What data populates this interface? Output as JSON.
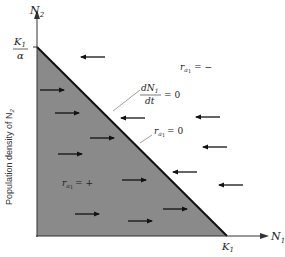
{
  "diagram": {
    "y_axis": {
      "label": "N",
      "label_sub": "2",
      "side_label": "Population density of N",
      "side_label_sub": "2",
      "intercept_num": "K",
      "intercept_num_sub": "1",
      "intercept_den": "α"
    },
    "x_axis": {
      "label": "N",
      "label_sub": "1",
      "intercept": "K",
      "intercept_sub": "1"
    },
    "isocline_label": {
      "num": "dN",
      "num_sub": "1",
      "den": "dt",
      "eq": "= 0"
    },
    "ra_zero_label": {
      "r": "r",
      "sub": "a",
      "subsub": "1",
      "eq": "= 0"
    },
    "ra_pos_label": {
      "r": "r",
      "sub": "a",
      "subsub": "1",
      "eq": "= +"
    },
    "ra_neg_label": {
      "r": "r",
      "sub": "a",
      "subsub": "1",
      "eq": "= −"
    },
    "colors": {
      "fill": "#8a8a8a",
      "line": "#111111",
      "text": "#222222",
      "leader": "#666666"
    },
    "arrows_left": [
      [
        80,
        57
      ],
      [
        120,
        118
      ],
      [
        195,
        117
      ],
      [
        202,
        147
      ],
      [
        172,
        172
      ],
      [
        218,
        185
      ]
    ],
    "arrows_right": [
      [
        40,
        90
      ],
      [
        55,
        113
      ],
      [
        90,
        138
      ],
      [
        58,
        154
      ],
      [
        122,
        180
      ],
      [
        75,
        214
      ],
      [
        128,
        221
      ],
      [
        163,
        209
      ]
    ]
  }
}
